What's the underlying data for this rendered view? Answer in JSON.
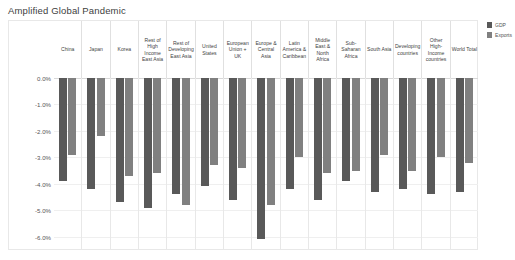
{
  "chart_data": {
    "type": "bar",
    "title": "Amplified Global Pandemic",
    "xlabel": "",
    "ylabel": "",
    "ylim": [
      -6.5,
      0.0
    ],
    "grid": true,
    "legend_position": "top-right",
    "ytick_labels": [
      "0.0%",
      "-1.0%",
      "-2.0%",
      "-3.0%",
      "-4.0%",
      "-5.0%",
      "-6.0%"
    ],
    "ytick_values": [
      0.0,
      -1.0,
      -2.0,
      -3.0,
      -4.0,
      -5.0,
      -6.0
    ],
    "categories": [
      "China",
      "Japan",
      "Korea",
      "Rest of High Income East Asia",
      "Rest of Developing East Asia",
      "United States",
      "European Union + UK",
      "Europe & Central Asia",
      "Latin America & Caribbean",
      "Middle East & North Africa",
      "Sub-Saharan Africa",
      "South Asia",
      "Developing countries",
      "Other High-Income countries",
      "World Total"
    ],
    "series": [
      {
        "name": "GDP",
        "color": "#595959",
        "values": [
          -3.9,
          -4.2,
          -4.7,
          -4.9,
          -4.4,
          -4.1,
          -4.6,
          -6.1,
          -4.2,
          -4.6,
          -3.9,
          -4.3,
          -4.2,
          -4.4,
          -4.3
        ]
      },
      {
        "name": "Exports",
        "color": "#808080",
        "values": [
          -2.9,
          -2.2,
          -3.7,
          -3.6,
          -4.8,
          -3.3,
          -3.4,
          -4.8,
          -3.0,
          -3.6,
          -3.5,
          -2.9,
          -3.5,
          -3.0,
          -3.2
        ]
      }
    ]
  },
  "legend": {
    "items": [
      {
        "label": "GDP",
        "color": "#595959"
      },
      {
        "label": "Exports",
        "color": "#808080"
      }
    ]
  }
}
